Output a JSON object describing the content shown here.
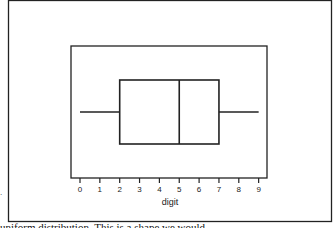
{
  "chart_data": {
    "type": "box",
    "title": "",
    "xlabel": "digit",
    "ylabel": "",
    "xlim": [
      0,
      9
    ],
    "ticks": [
      "0",
      "1",
      "2",
      "3",
      "4",
      "5",
      "6",
      "7",
      "8",
      "9"
    ],
    "grid": false,
    "legend": null,
    "box": {
      "min": 0,
      "q1": 2,
      "median": 5,
      "q3": 7,
      "max": 9
    }
  },
  "caption": "uniform distribution. This is a shape we would",
  "marker": "."
}
